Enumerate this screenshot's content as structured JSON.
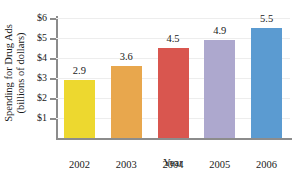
{
  "chart_data": {
    "type": "bar",
    "title": "",
    "xlabel": "Year",
    "ylabel_line1": "Spending for Drug Ads",
    "ylabel_line2": "(billions of dollars)",
    "categories": [
      "2002",
      "2003",
      "2004",
      "2005",
      "2006"
    ],
    "values": [
      2.9,
      3.6,
      4.5,
      4.9,
      5.5
    ],
    "value_labels": [
      "2.9",
      "3.6",
      "4.5",
      "4.9",
      "5.5"
    ],
    "bar_colors": [
      "#EDD82F",
      "#E8A74D",
      "#D9564F",
      "#ADA8CE",
      "#5B9BD1"
    ],
    "ylim": [
      0,
      6
    ],
    "ytick_values": [
      1,
      2,
      3,
      4,
      5,
      6
    ],
    "ytick_labels": [
      "$1",
      "$2",
      "$3",
      "$4",
      "$5",
      "$6"
    ],
    "grid": true,
    "grid_axis": "y",
    "legend": false,
    "legend_position": "none"
  }
}
